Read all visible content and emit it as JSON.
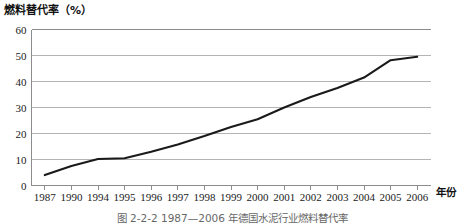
{
  "figure": {
    "caption": "图 2-2-2    1987—2006 年德国水泥行业燃料替代率",
    "y_axis_title": "燃料替代率（%）",
    "x_axis_name": "年份"
  },
  "chart_data": {
    "type": "line",
    "title": "图 2-2-2    1987—2006 年德国水泥行业燃料替代率",
    "xlabel": "年份",
    "ylabel": "燃料替代率（%）",
    "categories": [
      "1987",
      "1990",
      "1994",
      "1995",
      "1996",
      "1997",
      "1998",
      "1999",
      "2000",
      "2001",
      "2002",
      "2003",
      "2004",
      "2005",
      "2006"
    ],
    "values": [
      4,
      7.5,
      10.2,
      10.5,
      13,
      15.8,
      19,
      22.5,
      25.5,
      30,
      34,
      37.5,
      41.5,
      48.2,
      49.5
    ],
    "ylim": [
      0,
      60
    ],
    "yticks": [
      0,
      10,
      20,
      30,
      40,
      50,
      60
    ],
    "xticks": [
      "1987",
      "1990",
      "1994",
      "1995",
      "1996",
      "1997",
      "1998",
      "1999",
      "2000",
      "2001",
      "2002",
      "2003",
      "2004",
      "2005",
      "2006"
    ],
    "grid": true,
    "legend": false,
    "series_color": "#1a1a1a",
    "grid_color": "#b4b4b4",
    "axis_color": "#8c8c8c"
  }
}
